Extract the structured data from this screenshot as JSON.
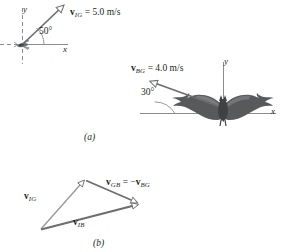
{
  "figure": {
    "panels": [
      {
        "id": "a",
        "caption": "(a)",
        "subject": "insect",
        "subject_icon": "insect-icon",
        "axes": {
          "x_label": "x",
          "y_label": "y"
        },
        "vector": {
          "name": "v",
          "subscript": "IG",
          "equals": " = 5.0 m/s",
          "magnitude": "5.0",
          "units": "m/s",
          "angle": "50°",
          "angle_value": 50,
          "direction_deg": 50
        }
      },
      {
        "id": "a2",
        "subject": "bat",
        "subject_icon": "bat-icon",
        "axes": {
          "x_label": "x",
          "y_label": "y"
        },
        "vector": {
          "name": "v",
          "subscript": "BG",
          "equals": " = 4.0 m/s",
          "magnitude": "4.0",
          "units": "m/s",
          "angle": "30°",
          "angle_value": 30,
          "direction_deg": 150
        }
      },
      {
        "id": "b",
        "caption": "(b)",
        "type": "vector-triangle",
        "vectors": [
          {
            "name": "v",
            "subscript": "IG",
            "label_extra": ""
          },
          {
            "name": "v",
            "subscript": "GB",
            "label_extra": " = −",
            "second_name": "v",
            "second_subscript": "BG"
          },
          {
            "name": "v",
            "subscript": "IB",
            "label_extra": ""
          }
        ]
      }
    ],
    "colors": {
      "ink": "#231f20",
      "vector_stroke": "#6d6e71",
      "axis": "#8a8c8e",
      "bat_fill": "#58595b",
      "background": "#ffffff"
    }
  }
}
